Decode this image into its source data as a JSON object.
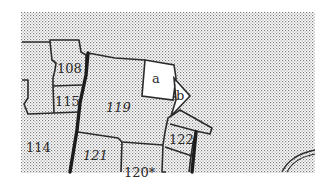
{
  "map": {
    "type": "cadastral-parcel-map",
    "colors": {
      "background": "#ffffff",
      "stipple_dot": "#7a7a7a",
      "boundary": "#2b2b2b",
      "label": "#2a2a2a"
    },
    "parcels": [
      {
        "id": "108",
        "label": "108"
      },
      {
        "id": "115",
        "label": "115"
      },
      {
        "id": "119",
        "label": "119"
      },
      {
        "id": "114",
        "label": "114"
      },
      {
        "id": "121",
        "label": "121"
      },
      {
        "id": "120",
        "label": "120*"
      },
      {
        "id": "122",
        "label": "122"
      }
    ],
    "sublots": [
      {
        "id": "a",
        "label": "a"
      },
      {
        "id": "b",
        "label": "b"
      }
    ]
  }
}
